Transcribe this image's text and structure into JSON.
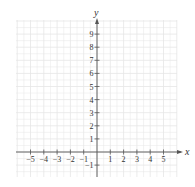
{
  "chart_data": {
    "type": "scatter",
    "title": "",
    "xlabel": "x",
    "ylabel": "y",
    "xlim": [
      -5.5,
      5.5
    ],
    "ylim": [
      -2,
      10
    ],
    "x_ticks": [
      -5,
      -4,
      -3,
      -2,
      -1,
      1,
      2,
      3,
      4,
      5
    ],
    "x_tick_labels": [
      "−5",
      "−4",
      "−3",
      "−2",
      "−1",
      "1",
      "2",
      "3",
      "4",
      "5"
    ],
    "y_ticks": [
      -1,
      1,
      2,
      3,
      4,
      5,
      6,
      7,
      8,
      9
    ],
    "y_tick_labels": [
      "−1",
      "1",
      "2",
      "3",
      "4",
      "5",
      "6",
      "7",
      "8",
      "9"
    ],
    "grid": true,
    "legend": null,
    "series": [],
    "points": []
  },
  "colors": {
    "axis": "#555555",
    "grid": "#e6e6e6",
    "text": "#333333"
  },
  "layout": {
    "origin_px": [
      97,
      152
    ],
    "unit_x_px": 13.3,
    "unit_y_px": 13.1,
    "grid_px": {
      "left": 16,
      "right": 177,
      "top": 20,
      "bottom": 177
    }
  }
}
